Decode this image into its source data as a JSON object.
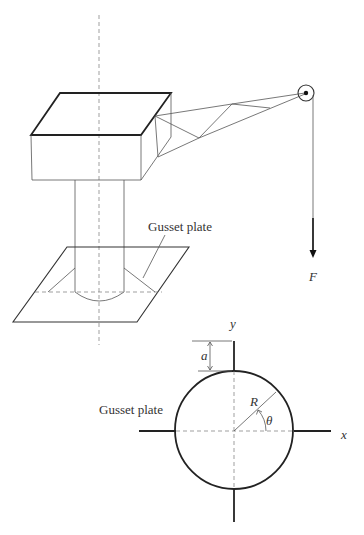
{
  "figure": {
    "top_view": {
      "gusset_label": "Gusset plate",
      "force_label": "F"
    },
    "section_view": {
      "gusset_label": "Gusset plate",
      "x_axis_label": "x",
      "y_axis_label": "y",
      "radius_label": "R",
      "angle_label": "θ",
      "offset_label": "a"
    }
  }
}
